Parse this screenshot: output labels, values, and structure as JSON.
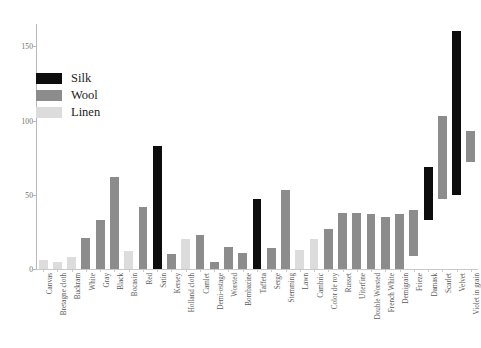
{
  "chart_data": {
    "type": "bar",
    "title": "",
    "subtitle": "",
    "xlabel": "",
    "ylabel": "",
    "ylim": [
      0,
      165
    ],
    "yticks": [
      0,
      50,
      100,
      150
    ],
    "ytick_labels": [
      "0",
      "50",
      "100",
      "150"
    ],
    "grid": false,
    "legend_position": "upper-left",
    "orientation": "vertical",
    "note": "Bars are colored by material class; right-hand bars are floating range bars (base > 0).",
    "legend": [
      {
        "label": "Silk",
        "color": "#0d0d0d"
      },
      {
        "label": "Wool",
        "color": "#8c8c8c"
      },
      {
        "label": "Linen",
        "color": "#dcdcdc"
      }
    ],
    "categories": [
      "Canvas",
      "Bretagne cloth",
      "Buckram",
      "White",
      "Gray",
      "Black",
      "Bocasin",
      "Red",
      "Satin",
      "Kersey",
      "Holland cloth",
      "Camlet",
      "Demi-ostage",
      "Worsted",
      "Bombazine",
      "Taffeta",
      "Serge",
      "Stemming",
      "Lawn",
      "Cambric",
      "Color de roy",
      "Russet",
      "Uiterfine",
      "Double Worsted",
      "French White",
      "Demigrain",
      "Frieze",
      "Damask",
      "Scarlet",
      "Velvet",
      "Violet in grain"
    ],
    "bars": [
      {
        "category": "Canvas",
        "material": "Linen",
        "base": 0,
        "top": 6
      },
      {
        "category": "Bretagne cloth",
        "material": "Linen",
        "base": 0,
        "top": 5
      },
      {
        "category": "Buckram",
        "material": "Linen",
        "base": 0,
        "top": 8
      },
      {
        "category": "White",
        "material": "Wool",
        "base": 0,
        "top": 21
      },
      {
        "category": "Gray",
        "material": "Wool",
        "base": 0,
        "top": 33
      },
      {
        "category": "Black",
        "material": "Wool",
        "base": 0,
        "top": 62
      },
      {
        "category": "Bocasin",
        "material": "Linen",
        "base": 0,
        "top": 12
      },
      {
        "category": "Red",
        "material": "Wool",
        "base": 0,
        "top": 42
      },
      {
        "category": "Satin",
        "material": "Silk",
        "base": 0,
        "top": 83
      },
      {
        "category": "Kersey",
        "material": "Wool",
        "base": 0,
        "top": 10
      },
      {
        "category": "Holland cloth",
        "material": "Linen",
        "base": 0,
        "top": 20
      },
      {
        "category": "Camlet",
        "material": "Wool",
        "base": 0,
        "top": 23
      },
      {
        "category": "Demi-ostage",
        "material": "Wool",
        "base": 0,
        "top": 5
      },
      {
        "category": "Worsted",
        "material": "Wool",
        "base": 0,
        "top": 15
      },
      {
        "category": "Bombazine",
        "material": "Wool",
        "base": 0,
        "top": 11
      },
      {
        "category": "Taffeta",
        "material": "Silk",
        "base": 0,
        "top": 47
      },
      {
        "category": "Serge",
        "material": "Wool",
        "base": 0,
        "top": 14
      },
      {
        "category": "Stemming",
        "material": "Wool",
        "base": 0,
        "top": 53
      },
      {
        "category": "Lawn",
        "material": "Linen",
        "base": 0,
        "top": 13
      },
      {
        "category": "Cambric",
        "material": "Linen",
        "base": 0,
        "top": 20
      },
      {
        "category": "Color de roy",
        "material": "Wool",
        "base": 0,
        "top": 27
      },
      {
        "category": "Russet",
        "material": "Wool",
        "base": 0,
        "top": 38
      },
      {
        "category": "Uiterfine",
        "material": "Wool",
        "base": 0,
        "top": 38
      },
      {
        "category": "Double Worsted",
        "material": "Wool",
        "base": 0,
        "top": 37
      },
      {
        "category": "French White",
        "material": "Wool",
        "base": 0,
        "top": 35
      },
      {
        "category": "Demigrain",
        "material": "Wool",
        "base": 0,
        "top": 37
      },
      {
        "category": "Frieze",
        "material": "Wool",
        "base": 9,
        "top": 40
      },
      {
        "category": "Damask",
        "material": "Silk",
        "base": 33,
        "top": 69
      },
      {
        "category": "Scarlet",
        "material": "Wool",
        "base": 47,
        "top": 103
      },
      {
        "category": "Velvet",
        "material": "Silk",
        "base": 50,
        "top": 160
      },
      {
        "category": "Violet in grain",
        "material": "Wool",
        "base": 72,
        "top": 93
      }
    ]
  }
}
